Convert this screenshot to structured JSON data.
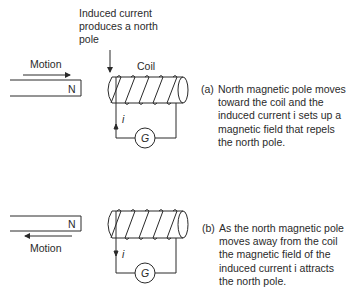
{
  "panel_a": {
    "annotation_lines": [
      "Induced current",
      "produces a north",
      "pole"
    ],
    "motion_label": "Motion",
    "magnet_pole": "N",
    "coil_label": "Coil",
    "current_label": "i",
    "galvanometer_label": "G",
    "caption_label": "(a)",
    "caption_lines": [
      "North magnetic pole moves",
      "toward the coil and the",
      "induced current i sets up a",
      "magnetic field that repels",
      "the north pole."
    ]
  },
  "panel_b": {
    "motion_label": "Motion",
    "magnet_pole": "N",
    "current_label": "i",
    "galvanometer_label": "G",
    "caption_label": "(b)",
    "caption_lines": [
      "As the north magnetic pole",
      "moves away from the coil",
      "the magnetic field of the",
      "induced current i attracts",
      "the north pole."
    ]
  },
  "colors": {
    "ink": "#2a2a2a",
    "background": "#ffffff"
  }
}
